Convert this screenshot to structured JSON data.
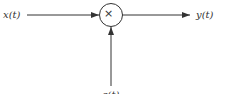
{
  "diagram": {
    "type": "block-diagram",
    "input_label": "x(t)",
    "output_label": "y(t)",
    "operator_symbol": "×",
    "bottom_input_label": "c(t)",
    "colors": {
      "line": "#333333",
      "background": "#ffffff"
    }
  }
}
